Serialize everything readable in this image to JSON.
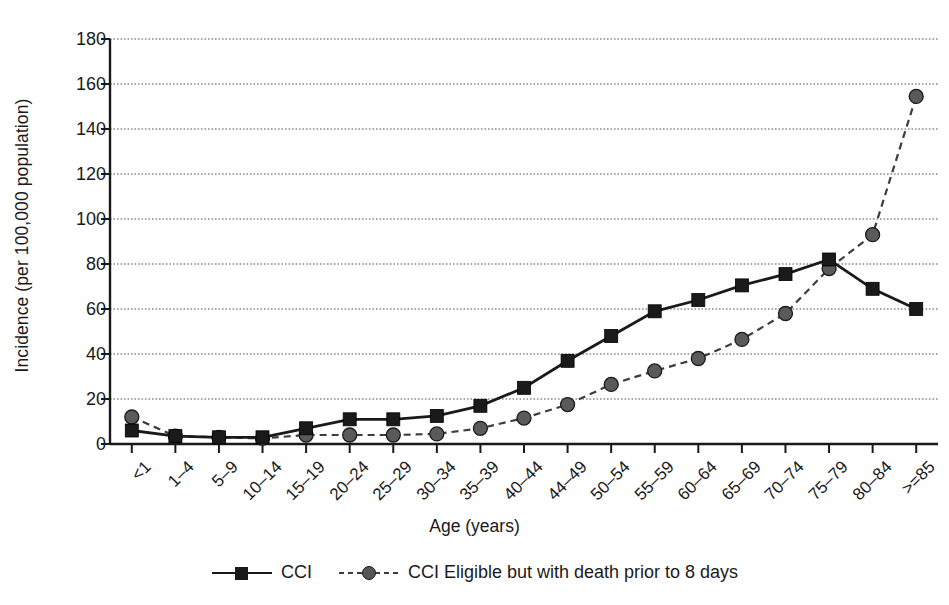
{
  "chart_data": {
    "type": "line",
    "title": "",
    "xlabel": "Age (years)",
    "ylabel": "Incidence (per 100,000 population)",
    "categories": [
      "<1",
      "1–4",
      "5–9",
      "10–14",
      "15–19",
      "20–24",
      "25–29",
      "30–34",
      "35–39",
      "40–44",
      "44–49",
      "50–54",
      "55–59",
      "60–64",
      "65–69",
      "70–74",
      "75–79",
      "80–84",
      ">=85"
    ],
    "series": [
      {
        "name": "CCI",
        "marker": "square",
        "line_style": "solid",
        "color": "#1a1a1a",
        "values": [
          6,
          3.5,
          3,
          3,
          7,
          11,
          11,
          12.5,
          17,
          25,
          37,
          48,
          59,
          64,
          70.5,
          75.5,
          82,
          69,
          60
        ]
      },
      {
        "name": "CCI Eligible but with death prior to 8 days",
        "marker": "circle",
        "line_style": "dashed",
        "color": "#4d4d4d",
        "values": [
          12,
          3.5,
          3,
          2.5,
          4,
          4,
          4,
          4.5,
          7,
          11.5,
          17.5,
          26.5,
          32.5,
          38,
          46.5,
          58,
          78,
          93,
          154.5
        ]
      }
    ],
    "ylim": [
      0,
      180
    ],
    "yticks": [
      0,
      20,
      40,
      60,
      80,
      100,
      120,
      140,
      160,
      180
    ],
    "ytick_labels": [
      "0",
      "20",
      "40",
      "60",
      "80",
      "100",
      "120",
      "140",
      "160",
      "180"
    ],
    "grid": true,
    "grid_style": "dotted-horizontal",
    "legend_position": "bottom-center"
  },
  "legend": {
    "entries": [
      {
        "label": "CCI",
        "key": "solid-square-key"
      },
      {
        "label": "CCI Eligible but with death prior to 8 days",
        "key": "dashed-circle-key"
      }
    ]
  },
  "axes": {
    "x_title": "Age (years)",
    "y_title": "Incidence (per 100,000 population)"
  },
  "colors": {
    "foreground": "#1a1a1a",
    "series_cci": "#1a1a1a",
    "series_cci_eligible": "#4d4d4d",
    "grid": "#8c8c8c",
    "background": "#ffffff"
  }
}
